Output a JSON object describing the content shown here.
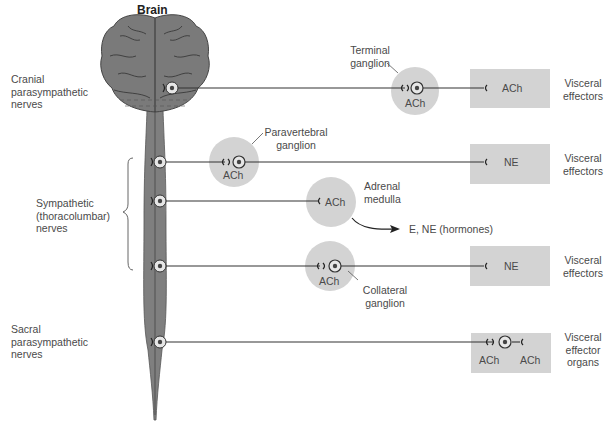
{
  "title": "Brain",
  "colors": {
    "cns_fill": "#7f7f7f",
    "ganglion_fill": "#d3d3d3",
    "effector_fill": "#d3d3d3",
    "line": "#333333",
    "text": "#4a4a4a"
  },
  "divisions": {
    "cranial": [
      "Cranial",
      "parasympathetic",
      "nerves"
    ],
    "sympathetic": [
      "Sympathetic",
      "(thoracolumbar)",
      "nerves"
    ],
    "sacral": [
      "Sacral",
      "parasympathetic",
      "nerves"
    ]
  },
  "ganglia": {
    "terminal": {
      "label": [
        "Terminal",
        "ganglion"
      ],
      "neurotransmitter": "ACh"
    },
    "paravertebral": {
      "label": [
        "Paravertebral",
        "ganglion"
      ],
      "neurotransmitter": "ACh"
    },
    "adrenal": {
      "label": [
        "Adrenal",
        "medulla"
      ],
      "neurotransmitter": "ACh",
      "output": "E, NE (hormones)"
    },
    "collateral": {
      "label": [
        "Collateral",
        "ganglion"
      ],
      "neurotransmitter": "ACh"
    }
  },
  "effectors": {
    "row1": {
      "neurotransmitter": "ACh",
      "label": [
        "Visceral",
        "effectors"
      ]
    },
    "row2": {
      "neurotransmitter": "NE",
      "label": [
        "Visceral",
        "effectors"
      ]
    },
    "row4": {
      "neurotransmitter": "NE",
      "label": [
        "Visceral",
        "effectors"
      ]
    },
    "row5": {
      "neurotransmitter_left": "ACh",
      "neurotransmitter_right": "ACh",
      "label": [
        "Visceral",
        "effector",
        "organs"
      ]
    }
  }
}
